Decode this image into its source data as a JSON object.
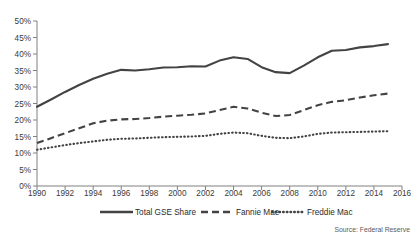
{
  "chart_data": {
    "type": "line",
    "title": "",
    "xlabel": "",
    "ylabel": "",
    "xlim": [
      1990,
      2016
    ],
    "ylim": [
      0,
      0.5
    ],
    "grid": false,
    "legend_position": "bottom",
    "x": [
      1990,
      1991,
      1992,
      1993,
      1994,
      1995,
      1996,
      1997,
      1998,
      1999,
      2000,
      2001,
      2002,
      2003,
      2004,
      2005,
      2006,
      2007,
      2008,
      2009,
      2010,
      2011,
      2012,
      2013,
      2014,
      2015
    ],
    "y_tick_labels": [
      "0%",
      "5%",
      "10%",
      "15%",
      "20%",
      "25%",
      "30%",
      "35%",
      "40%",
      "45%",
      "50%"
    ],
    "y_tick_values": [
      0,
      5,
      10,
      15,
      20,
      25,
      30,
      35,
      40,
      45,
      50
    ],
    "x_tick_labels": [
      "1990",
      "1992",
      "1994",
      "1996",
      "1998",
      "2000",
      "2002",
      "2004",
      "2006",
      "2008",
      "2010",
      "2012",
      "2014",
      "2016"
    ],
    "x_tick_values": [
      1990,
      1992,
      1994,
      1996,
      1998,
      2000,
      2002,
      2004,
      2006,
      2008,
      2010,
      2012,
      2014,
      2016
    ],
    "series": [
      {
        "name": "Total GSE Share",
        "style": "solid",
        "color": "#434343",
        "values": [
          24.0,
          26.2,
          28.5,
          30.6,
          32.5,
          34.0,
          35.2,
          35.0,
          35.4,
          35.9,
          36.0,
          36.3,
          36.2,
          38.0,
          39.0,
          38.5,
          36.0,
          34.5,
          34.2,
          36.5,
          39.0,
          41.0,
          41.2,
          42.0,
          42.4,
          43.0
        ]
      },
      {
        "name": "Fannie Mae",
        "style": "dashed",
        "color": "#434343",
        "values": [
          13.0,
          14.5,
          16.0,
          17.5,
          19.0,
          19.8,
          20.2,
          20.3,
          20.6,
          21.0,
          21.3,
          21.6,
          22.0,
          23.0,
          24.0,
          23.5,
          22.2,
          21.2,
          21.5,
          23.0,
          24.5,
          25.5,
          26.0,
          26.8,
          27.5,
          28.0
        ]
      },
      {
        "name": "Freddie Mac",
        "style": "dotted",
        "color": "#434343",
        "values": [
          11.0,
          11.7,
          12.4,
          13.0,
          13.5,
          14.0,
          14.3,
          14.4,
          14.6,
          14.8,
          14.9,
          15.0,
          15.2,
          15.8,
          16.2,
          16.0,
          15.2,
          14.6,
          14.5,
          15.0,
          15.8,
          16.2,
          16.3,
          16.4,
          16.5,
          16.6
        ]
      }
    ],
    "source_note": "Source: Federal Reserve"
  },
  "legend": {
    "items": [
      {
        "label": "Total GSE Share"
      },
      {
        "label": "Fannie Mae"
      },
      {
        "label": "Freddie Mac"
      }
    ]
  }
}
